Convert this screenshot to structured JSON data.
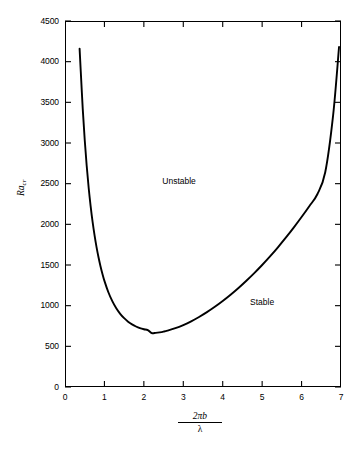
{
  "chart_data": {
    "type": "line",
    "title": "",
    "subtitle": "",
    "xlabel_numerator": "2πb",
    "xlabel_denominator": "λ",
    "ylabel": "Ra",
    "ylabel_subscript": "cr",
    "xlim": [
      0,
      7
    ],
    "ylim": [
      0,
      4500
    ],
    "xticks": [
      0,
      1,
      2,
      3,
      4,
      5,
      6,
      7
    ],
    "yticks": [
      0,
      500,
      1000,
      1500,
      2000,
      2500,
      3000,
      3500,
      4000,
      4500
    ],
    "xtick_labels": [
      "0",
      "1",
      "2",
      "3",
      "4",
      "5",
      "6",
      "7"
    ],
    "ytick_labels": [
      "0",
      "500",
      "1000",
      "1500",
      "2000",
      "2500",
      "3000",
      "3500",
      "4000",
      "4500"
    ],
    "grid": false,
    "legend": "none",
    "series": [
      {
        "name": "critical Rayleigh number curve",
        "color": "#000000",
        "linewidth": 1.9,
        "x": [
          0.37,
          0.4,
          0.45,
          0.5,
          0.55,
          0.6,
          0.65,
          0.7,
          0.75,
          0.8,
          0.85,
          0.9,
          0.95,
          1.0,
          1.1,
          1.2,
          1.3,
          1.4,
          1.5,
          1.6,
          1.7,
          1.8,
          1.9,
          2.0,
          2.1,
          2.2,
          2.3,
          2.4,
          2.5,
          2.6,
          2.8,
          3.0,
          3.2,
          3.4,
          3.6,
          3.8,
          4.0,
          4.2,
          4.4,
          4.6,
          4.8,
          5.0,
          5.2,
          5.4,
          5.6,
          5.8,
          6.0,
          6.2,
          6.4,
          6.6,
          6.8,
          6.95
        ],
        "y": [
          4160,
          3880,
          3420,
          3040,
          2720,
          2450,
          2225,
          2030,
          1865,
          1720,
          1595,
          1485,
          1390,
          1305,
          1165,
          1055,
          968,
          900,
          846,
          803,
          770,
          744,
          724,
          710,
          700,
          663,
          666,
          672,
          681,
          693,
          723,
          762,
          808,
          861,
          920,
          986,
          1057,
          1134,
          1217,
          1306,
          1400,
          1500,
          1606,
          1718,
          1836,
          1960,
          2090,
          2226,
          2370,
          2640,
          3340,
          4180
        ]
      }
    ],
    "annotations": [
      {
        "text": "Unstable",
        "x": 3.0,
        "y": 2530
      },
      {
        "text": "Stable",
        "x": 5.1,
        "y": 1040
      }
    ],
    "minimum": {
      "x": 2.2,
      "y": 660
    },
    "colors": {
      "curve": "#000000",
      "axis": "#000000",
      "background": "#ffffff",
      "text": "#000000"
    }
  }
}
